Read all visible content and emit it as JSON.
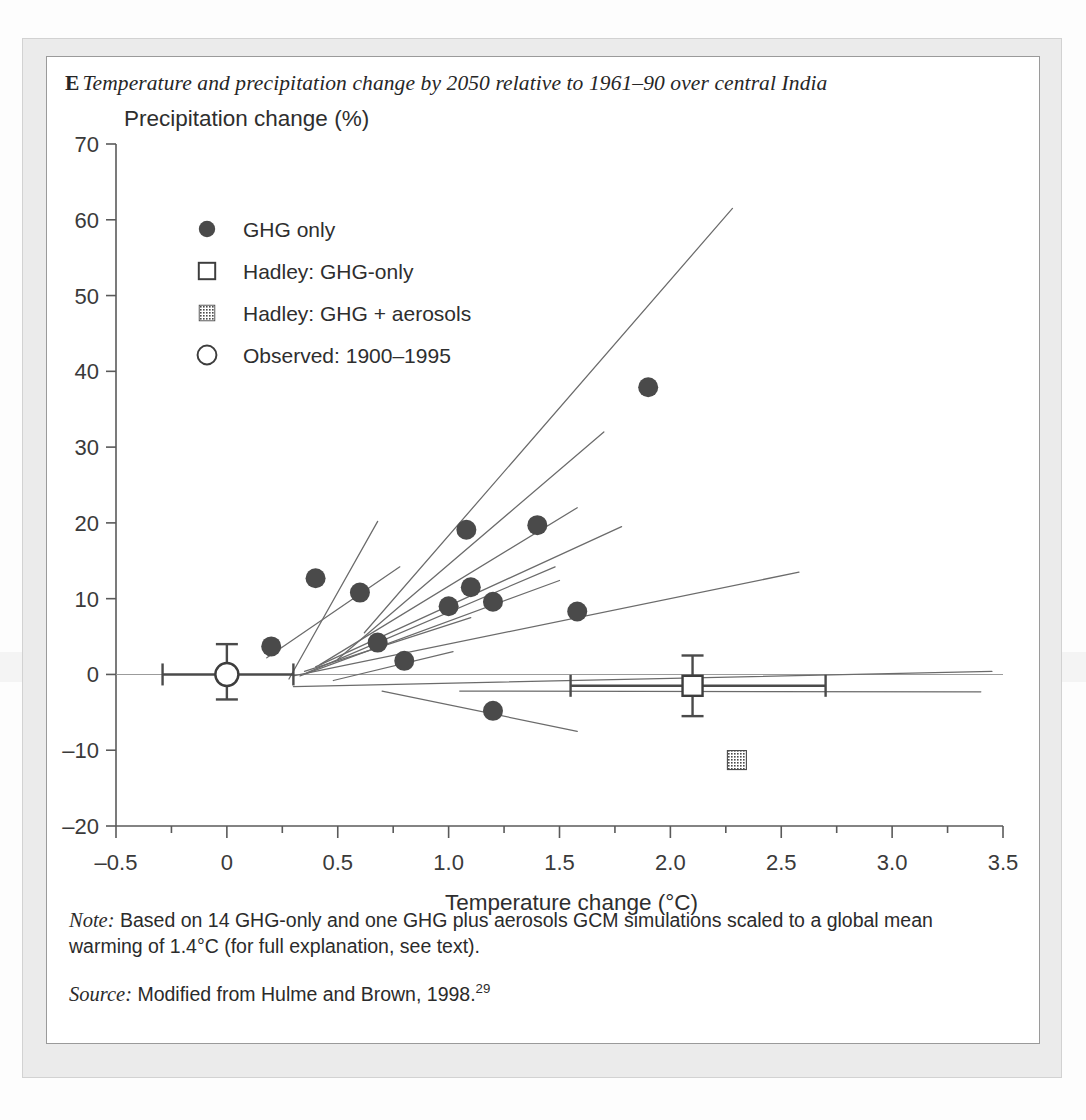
{
  "figure": {
    "panel_letter": "E",
    "title": "Temperature and precipitation change by 2050 relative to 1961–90 over central India",
    "note_label": "Note:",
    "note_text": " Based on 14 GHG-only and one GHG plus aerosols GCM simulations scaled to a global mean warming of 1.4°C (for full explanation, see text).",
    "source_label": "Source:",
    "source_text": " Modified from Hulme and Brown, 1998.",
    "source_superscript": "29"
  },
  "colors": {
    "marker_fill": "#4a4a4a",
    "line": "#6b6b6b",
    "axis": "#5a5a5a",
    "text": "#2b2b2b",
    "page_background": "#ebebeb",
    "figure_background": "#ffffff"
  },
  "chart_data": {
    "type": "scatter",
    "title": "Temperature and precipitation change by 2050 relative to 1961–90 over central India",
    "xlabel": "Temperature change (°C)",
    "ylabel": "Precipitation change (%)",
    "xlim": [
      -0.5,
      3.5
    ],
    "ylim": [
      -20,
      70
    ],
    "xticks": [
      -0.5,
      0,
      0.5,
      1.0,
      1.5,
      2.0,
      2.5,
      3.0,
      3.5
    ],
    "xtick_labels": [
      "–0.5",
      "0",
      "0.5",
      "1.0",
      "1.5",
      "2.0",
      "2.5",
      "3.0",
      "3.5"
    ],
    "xminor_step": 0.25,
    "yticks": [
      -20,
      -10,
      0,
      10,
      20,
      30,
      40,
      50,
      60,
      70
    ],
    "ytick_labels": [
      "–20",
      "–10",
      "0",
      "10",
      "20",
      "30",
      "40",
      "50",
      "60",
      "70"
    ],
    "grid": false,
    "legend_position": "upper-left",
    "legend": [
      {
        "marker": "filled-circle",
        "label": "GHG only"
      },
      {
        "marker": "open-square",
        "label": "Hadley: GHG-only"
      },
      {
        "marker": "hatched-square",
        "label": "Hadley: GHG + aerosols"
      },
      {
        "marker": "open-circle",
        "label": "Observed: 1900–1995"
      }
    ],
    "series": [
      {
        "name": "GHG only",
        "marker": "filled-circle",
        "points": [
          {
            "x": 0.2,
            "y": 3.7
          },
          {
            "x": 0.4,
            "y": 12.7
          },
          {
            "x": 0.6,
            "y": 10.8
          },
          {
            "x": 0.68,
            "y": 4.2
          },
          {
            "x": 0.8,
            "y": 1.8
          },
          {
            "x": 1.0,
            "y": 9.0
          },
          {
            "x": 1.08,
            "y": 19.1
          },
          {
            "x": 1.1,
            "y": 11.5
          },
          {
            "x": 1.2,
            "y": 9.6
          },
          {
            "x": 1.2,
            "y": -4.8
          },
          {
            "x": 1.4,
            "y": 19.7
          },
          {
            "x": 1.58,
            "y": 8.3
          },
          {
            "x": 1.9,
            "y": 37.9
          }
        ]
      },
      {
        "name": "Hadley: GHG-only",
        "marker": "open-square",
        "points": [
          {
            "x": 2.1,
            "y": -1.5,
            "xerr_low": 1.55,
            "xerr_high": 2.7,
            "yerr_low": -5.5,
            "yerr_high": 2.5
          }
        ]
      },
      {
        "name": "Hadley: GHG + aerosols",
        "marker": "hatched-square",
        "points": [
          {
            "x": 2.3,
            "y": -11.3
          }
        ]
      },
      {
        "name": "Observed: 1900–1995",
        "marker": "open-circle",
        "points": [
          {
            "x": 0.0,
            "y": 0.0,
            "xerr_low": -0.29,
            "xerr_high": 0.3,
            "yerr_low": -3.3,
            "yerr_high": 4.0
          }
        ]
      }
    ],
    "trend_lines": [
      {
        "x1": 0.28,
        "y1": -0.6,
        "x2": 0.68,
        "y2": 20.2
      },
      {
        "x1": 0.18,
        "y1": 2.2,
        "x2": 0.78,
        "y2": 14.2
      },
      {
        "x1": 0.62,
        "y1": 5.5,
        "x2": 2.28,
        "y2": 61.5
      },
      {
        "x1": 0.5,
        "y1": 2.0,
        "x2": 1.7,
        "y2": 32.0
      },
      {
        "x1": 0.42,
        "y1": 1.3,
        "x2": 1.58,
        "y2": 22.0
      },
      {
        "x1": 0.4,
        "y1": 1.0,
        "x2": 1.78,
        "y2": 19.5
      },
      {
        "x1": 0.36,
        "y1": 0.2,
        "x2": 1.48,
        "y2": 14.2
      },
      {
        "x1": 0.33,
        "y1": -0.2,
        "x2": 1.5,
        "y2": 12.4
      },
      {
        "x1": 0.35,
        "y1": 0.4,
        "x2": 1.1,
        "y2": 7.5
      },
      {
        "x1": 0.3,
        "y1": -0.2,
        "x2": 2.58,
        "y2": 13.5
      },
      {
        "x1": 0.48,
        "y1": -0.8,
        "x2": 1.02,
        "y2": 3.0
      },
      {
        "x1": 0.3,
        "y1": -1.6,
        "x2": 3.45,
        "y2": 0.4
      },
      {
        "x1": 1.05,
        "y1": -2.2,
        "x2": 3.4,
        "y2": -2.3
      },
      {
        "x1": 0.7,
        "y1": -2.2,
        "x2": 1.58,
        "y2": -7.5
      }
    ]
  }
}
